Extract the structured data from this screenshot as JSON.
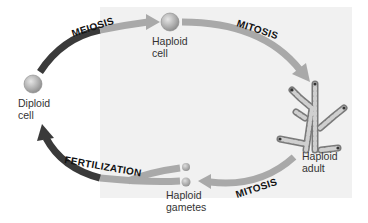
{
  "diagram": {
    "stages": [
      {
        "id": "diploid-cell",
        "label_line1": "Diploid",
        "label_line2": "cell"
      },
      {
        "id": "haploid-cell",
        "label_line1": "Haploid",
        "label_line2": "cell"
      },
      {
        "id": "haploid-adult",
        "label_line1": "Haploid",
        "label_line2": "adult"
      },
      {
        "id": "haploid-gametes",
        "label_line1": "Haploid",
        "label_line2": "gametes"
      }
    ],
    "processes": [
      {
        "id": "meiosis",
        "label": "MEIOSIS",
        "from": "diploid-cell",
        "to": "haploid-cell"
      },
      {
        "id": "mitosis-1",
        "label": "MITOSIS",
        "from": "haploid-cell",
        "to": "haploid-adult"
      },
      {
        "id": "mitosis-2",
        "label": "MITOSIS",
        "from": "haploid-adult",
        "to": "haploid-gametes"
      },
      {
        "id": "fertilization",
        "label": "FERTILIZATION",
        "from": "haploid-gametes",
        "to": "diploid-cell"
      }
    ],
    "colors": {
      "diploid_arrow": "#3a3a3a",
      "haploid_arrow": "#a9a9a9",
      "haploid_panel": "#f1f1f1",
      "cell_fill": "#b5b5b5"
    }
  }
}
